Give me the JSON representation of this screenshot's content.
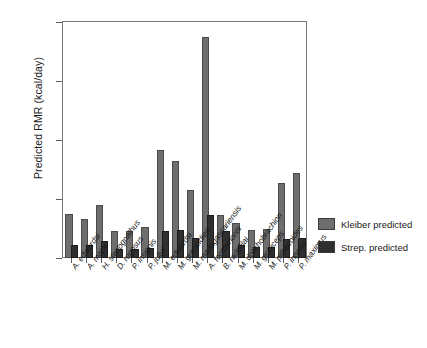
{
  "chart_data": {
    "type": "bar",
    "title": "",
    "xlabel": "",
    "ylabel": "Predicted RMR (kcal/day)",
    "ylim": [
      0,
      4000
    ],
    "yticks": [
      0,
      1000,
      2000,
      3000,
      4000
    ],
    "ytick_labels": [
      "0",
      "1000",
      "2000",
      "3000",
      "4000"
    ],
    "grid": false,
    "legend_position": "right",
    "categories": [
      "A. edwardsi",
      "A. major",
      "H. stenognathus",
      "D. rugosus",
      "P. insignis",
      "P. jullyi",
      "M. edwardsi",
      "M. grandidieri",
      "M. madagascariensis",
      "A. fontoynontii",
      "B. radofilai",
      "M. dolichobrachion",
      "M. globiceps",
      "M. pithecoides",
      "P. ingens",
      "P. maximus"
    ],
    "series": [
      {
        "name": "Kleiber predicted",
        "color": "#6e6e6e",
        "values": [
          710,
          620,
          870,
          430,
          430,
          500,
          1790,
          1610,
          1120,
          3720,
          690,
          560,
          440,
          460,
          1230,
          1410
        ]
      },
      {
        "name": "Strep. predicted",
        "color": "#2f2f2f",
        "values": [
          190,
          180,
          250,
          120,
          120,
          130,
          420,
          440,
          300,
          700,
          430,
          180,
          150,
          150,
          280,
          300
        ]
      }
    ]
  },
  "legend": {
    "items": [
      {
        "label": "Kleiber predicted",
        "color": "#6e6e6e"
      },
      {
        "label": "Strep. predicted",
        "color": "#2f2f2f"
      }
    ]
  }
}
